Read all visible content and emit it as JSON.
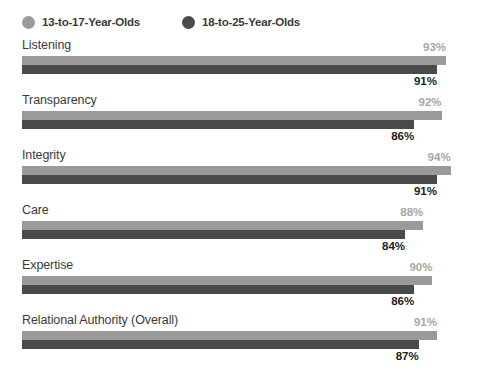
{
  "legend": {
    "entries": [
      {
        "label": "13-to-17-Year-Olds",
        "color": "#9a9a9a",
        "icon": "circle-swatch-icon"
      },
      {
        "label": "18-to-25-Year-Olds",
        "color": "#4a4a4a",
        "icon": "circle-swatch-icon"
      }
    ]
  },
  "chart_data": {
    "type": "bar",
    "orientation": "horizontal",
    "title": "",
    "subtitle": "",
    "xlabel": "",
    "ylabel": "",
    "xlim": [
      0,
      100
    ],
    "grid": false,
    "legend_position": "top-left",
    "categories": [
      "Listening",
      "Transparency",
      "Integrity",
      "Care",
      "Expertise",
      "Relational Authority (Overall)"
    ],
    "series": [
      {
        "name": "13-to-17-Year-Olds",
        "color": "#9a9a9a",
        "values": [
          93,
          92,
          94,
          88,
          90,
          91
        ],
        "value_labels": [
          "93%",
          "92%",
          "94%",
          "88%",
          "90%",
          "91%"
        ]
      },
      {
        "name": "18-to-25-Year-Olds",
        "color": "#4a4a4a",
        "values": [
          91,
          86,
          91,
          84,
          86,
          87
        ],
        "value_labels": [
          "91%",
          "86%",
          "91%",
          "84%",
          "86%",
          "87%"
        ]
      }
    ]
  }
}
